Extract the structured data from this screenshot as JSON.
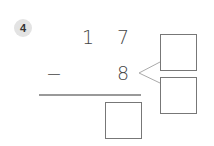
{
  "problem": {
    "number": "4",
    "minuend": {
      "tens": "1",
      "ones": "7"
    },
    "operator": "−",
    "subtrahend": "8"
  },
  "answer_boxes": {
    "decompose_top": "",
    "decompose_bottom": "",
    "result": ""
  },
  "colors": {
    "badge_bg": "#e3e3e3",
    "line": "#777777",
    "fork_line": "#aaaaaa",
    "text": "#444444"
  }
}
